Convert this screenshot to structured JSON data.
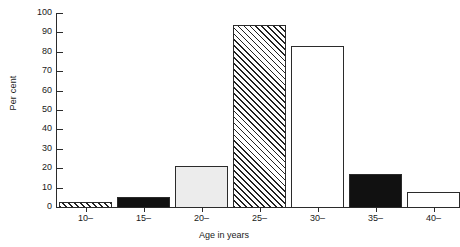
{
  "chart_data": {
    "type": "bar",
    "title": "",
    "subtitle": "",
    "xlabel": "Age in years",
    "ylabel": "Per cent",
    "categories": [
      "10–",
      "15–",
      "20–",
      "25–",
      "30–",
      "35–",
      "40–"
    ],
    "values": [
      2.5,
      5,
      21,
      94,
      83,
      17,
      7.5
    ],
    "bar_fills": [
      "hatch",
      "solid",
      "light",
      "hatch",
      "white",
      "solid",
      "white"
    ],
    "ylim": [
      0,
      100
    ],
    "ytick_labels": [
      "0",
      "10",
      "20",
      "30",
      "40",
      "50",
      "60",
      "70",
      "80",
      "90",
      "100"
    ],
    "ytick_values": [
      0,
      10,
      20,
      30,
      40,
      50,
      60,
      70,
      80,
      90,
      100
    ],
    "grid": false,
    "legend": null,
    "annotations": []
  },
  "colors": {
    "axis": "#2b2b2b",
    "text": "#1a1a1a",
    "bar_outline": "#2b2b2b",
    "fill_white": "#ffffff",
    "fill_light": "#ececec",
    "fill_solid": "#111111",
    "hatch_line": "#222222",
    "background": "#ffffff"
  }
}
